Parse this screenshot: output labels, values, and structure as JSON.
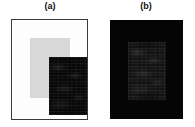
{
  "figure": {
    "background_color": "#ffffff",
    "width": 195,
    "height": 127,
    "panels": [
      {
        "id": "a",
        "caption": "(a)",
        "plate_style": "white background with thin dark border",
        "plate_background_color": "#fdfdfd",
        "plate_border_color": "#3a3a3a",
        "inner_halo_color": "#d8d8d8",
        "specimen_label": "dark textured rectangular specimen",
        "specimen_color": "#0a0a0a",
        "specimen_texture": "horizontal streaks with faint mottling"
      },
      {
        "id": "b",
        "caption": "(b)",
        "plate_style": "solid black background, no border",
        "plate_background_color": "#050505",
        "plate_border_color": "#050505",
        "inner_halo_color": "#050505",
        "specimen_label": "dark gray textured rectangular specimen",
        "specimen_color": "#171717",
        "specimen_texture": "horizontal streaks with faint mottling"
      }
    ]
  }
}
